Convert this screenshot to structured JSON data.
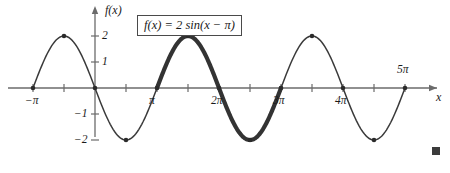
{
  "figure": {
    "formula_label": "f(x) = 2 sin(x − π)",
    "y_axis_name": "f(x)",
    "x_axis_name": "x",
    "qed_marker": "end-of-example-square"
  },
  "y_ticks": [
    {
      "label": "2",
      "value": 2
    },
    {
      "label": "1",
      "value": 1
    },
    {
      "label": "−1",
      "value": -1
    },
    {
      "label": "−2",
      "value": -2
    }
  ],
  "x_ticks": [
    {
      "label": "−π",
      "value": -3.14159,
      "labeled": true
    },
    {
      "label": "",
      "value": -1.5708,
      "labeled": false
    },
    {
      "label": "",
      "value": 0,
      "labeled": false
    },
    {
      "label": "",
      "value": 1.5708,
      "labeled": false
    },
    {
      "label": "π",
      "value": 3.14159,
      "labeled": true
    },
    {
      "label": "",
      "value": 4.71239,
      "labeled": false
    },
    {
      "label": "2π",
      "value": 6.28319,
      "labeled": true
    },
    {
      "label": "",
      "value": 7.85398,
      "labeled": false
    },
    {
      "label": "3π",
      "value": 9.42478,
      "labeled": true
    },
    {
      "label": "",
      "value": 10.99557,
      "labeled": false
    },
    {
      "label": "4π",
      "value": 12.56637,
      "labeled": true
    },
    {
      "label": "",
      "value": 14.13717,
      "labeled": false
    },
    {
      "label": "5π",
      "value": 15.70796,
      "labeled": true
    }
  ],
  "chart_data": {
    "type": "line",
    "title": "",
    "xlabel": "x",
    "ylabel": "f(x)",
    "function": "f(x) = 2 sin(x - pi)",
    "amplitude": 2,
    "period": "2π",
    "phase_shift": "π",
    "xlim": [
      -3.14159,
      15.70796
    ],
    "ylim": [
      -2.6,
      2.6
    ],
    "grid": false,
    "legend": "none",
    "annotations": [
      {
        "text": "f(x) = 2 sin(x − π)",
        "kind": "boxed-equation-label"
      }
    ],
    "highlighted_segment": {
      "description": "one full period drawn with a thick stroke",
      "x_start": 3.14159,
      "x_end": 9.42478,
      "x_start_label": "π",
      "x_end_label": "3π"
    },
    "marked_points": [
      {
        "x": -3.14159,
        "y": 0,
        "x_label": "−π",
        "kind": "x-intercept"
      },
      {
        "x": -1.5708,
        "y": 2,
        "x_label": "−π/2",
        "kind": "maximum"
      },
      {
        "x": 0,
        "y": 0,
        "x_label": "0",
        "kind": "x-intercept"
      },
      {
        "x": 1.5708,
        "y": -2,
        "x_label": "π/2",
        "kind": "minimum"
      },
      {
        "x": 3.14159,
        "y": 0,
        "x_label": "π",
        "kind": "x-intercept"
      },
      {
        "x": 4.71239,
        "y": 2,
        "x_label": "3π/2",
        "kind": "maximum"
      },
      {
        "x": 6.28319,
        "y": 0,
        "x_label": "2π",
        "kind": "x-intercept"
      },
      {
        "x": 7.85398,
        "y": -2,
        "x_label": "5π/2",
        "kind": "minimum"
      },
      {
        "x": 9.42478,
        "y": 0,
        "x_label": "3π",
        "kind": "x-intercept"
      },
      {
        "x": 10.99557,
        "y": 2,
        "x_label": "7π/2",
        "kind": "maximum"
      },
      {
        "x": 12.56637,
        "y": 0,
        "x_label": "4π",
        "kind": "x-intercept"
      },
      {
        "x": 14.13717,
        "y": -2,
        "x_label": "9π/2",
        "kind": "minimum"
      },
      {
        "x": 15.70796,
        "y": 0,
        "x_label": "5π",
        "kind": "x-intercept"
      }
    ],
    "x": [
      -3.14159,
      -2.74889,
      -2.35619,
      -1.9635,
      -1.5708,
      -1.1781,
      -0.7854,
      -0.3927,
      0.0,
      0.3927,
      0.7854,
      1.1781,
      1.5708,
      1.9635,
      2.35619,
      2.74889,
      3.14159,
      3.53429,
      3.92699,
      4.31969,
      4.71239,
      5.10509,
      5.49779,
      5.89049,
      6.28319,
      6.67588,
      7.06858,
      7.46128,
      7.85398,
      8.24668,
      8.63938,
      9.03208,
      9.42478,
      9.81748,
      10.21018,
      10.60288,
      10.99557,
      11.38827,
      11.78097,
      12.17367,
      12.56637,
      12.95907,
      13.35177,
      13.74447,
      14.13717,
      14.52987,
      14.92257,
      15.31527,
      15.70796
    ],
    "y": [
      0.0,
      1.53073,
      2.0,
      1.53073,
      0.0,
      -1.53073,
      -2.0,
      -1.53073,
      0.0,
      1.53073,
      2.0,
      1.53073,
      0.0,
      -1.53073,
      -2.0,
      -1.53073,
      0.0,
      1.53073,
      2.0,
      1.53073,
      0.0,
      -1.53073,
      -2.0,
      -1.53073,
      0.0,
      1.53073,
      2.0,
      1.53073,
      0.0,
      -1.53073,
      -2.0,
      -1.53073,
      0.0,
      1.53073,
      2.0,
      1.53073,
      0.0,
      -1.53073,
      -2.0,
      -1.53073,
      0.0,
      1.53073,
      2.0,
      1.53073,
      0.0,
      -1.53073,
      -2.0,
      -1.53073,
      0.0
    ]
  },
  "colors": {
    "curve": "#3a3a3a",
    "highlight": "#333333",
    "axis": "#6b6b6b",
    "text": "#1a1a1a",
    "background": "#ffffff"
  }
}
